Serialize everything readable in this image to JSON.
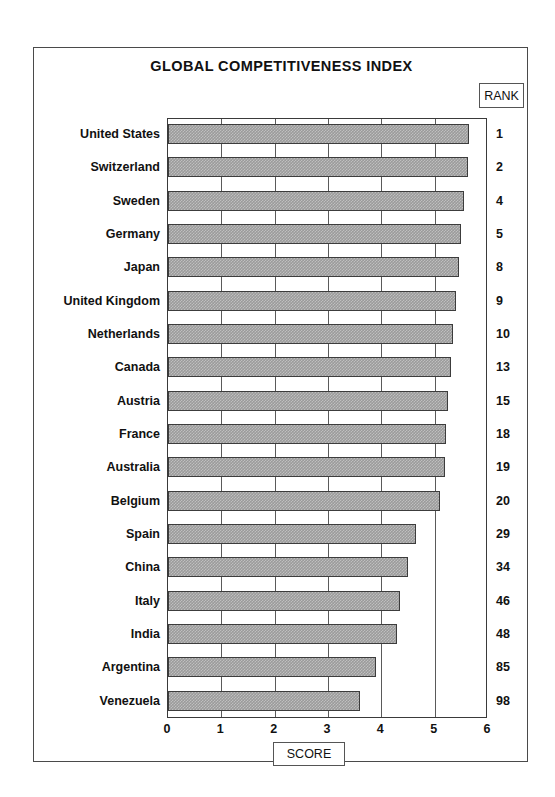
{
  "chart_data": {
    "type": "bar",
    "orientation": "horizontal",
    "title": "GLOBAL COMPETITIVENESS INDEX",
    "xlabel": "SCORE",
    "ylabel": "",
    "xlim": [
      0,
      6
    ],
    "xticks": [
      0,
      1,
      2,
      3,
      4,
      5,
      6
    ],
    "grid": true,
    "grid_axis": "x",
    "rank_header": "RANK",
    "categories": [
      "United States",
      "Switzerland",
      "Sweden",
      "Germany",
      "Japan",
      "United Kingdom",
      "Netherlands",
      "Canada",
      "Austria",
      "France",
      "Australia",
      "Belgium",
      "Spain",
      "China",
      "Italy",
      "India",
      "Argentina",
      "Venezuela"
    ],
    "values": [
      5.65,
      5.62,
      5.55,
      5.5,
      5.45,
      5.4,
      5.35,
      5.3,
      5.25,
      5.22,
      5.2,
      5.1,
      4.65,
      4.5,
      4.35,
      4.3,
      3.9,
      3.6
    ],
    "ranks": [
      "1",
      "2",
      "4",
      "5",
      "8",
      "9",
      "10",
      "13",
      "15",
      "18",
      "19",
      "20",
      "29",
      "34",
      "46",
      "48",
      "85",
      "98"
    ],
    "bar_color": "#9b9b9b",
    "bar_edge_color": "#3c3c3c"
  }
}
